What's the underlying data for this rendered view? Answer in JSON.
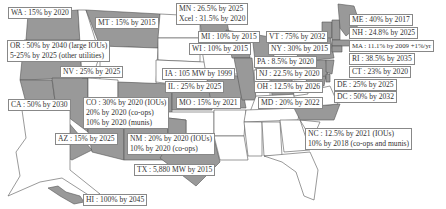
{
  "colors": {
    "policy_state": "#999999",
    "no_policy_state": "#ffffff",
    "border": "#555555",
    "label_border": "#888888"
  },
  "labels": {
    "WA": [
      "WA : 15% by 2020"
    ],
    "MT": [
      "MT : 15% by 2015"
    ],
    "OR": [
      "OR : 50% by 2040 (large IOUs)",
      "5-25% by 2025 (other utilities)"
    ],
    "NV": [
      "NV : 25% by 2025"
    ],
    "CA": [
      "CA : 50% by 2030"
    ],
    "AZ": [
      "AZ : 15% by 2025"
    ],
    "CO": [
      "CO : 30% by 2020 (IOUs)",
      "20% by 2020 (co-ops)",
      "10% by 2020 (munis)"
    ],
    "NM": [
      "NM : 20% by 2020 (IOUs)",
      "10% by 2020 (co-ops)"
    ],
    "TX": [
      "TX : 5,880 MW by 2015"
    ],
    "HI": [
      "HI : 100% by 2045"
    ],
    "MN": [
      "MN : 26.5% by 2025",
      "Xcel : 31.5% by 2020"
    ],
    "MI": [
      "MI : 10% by 2015"
    ],
    "WI": [
      "WI : 10% by 2015"
    ],
    "IA": [
      "IA : 105 MW by 1999"
    ],
    "IL": [
      "IL : 25% by 2025"
    ],
    "MO": [
      "MO : 15% by 2021"
    ],
    "VT": [
      "VT : 75% by 2032"
    ],
    "NY": [
      "NY : 30% by 2015"
    ],
    "PA": [
      "PA : 8.5% by 2020"
    ],
    "NJ": [
      "NJ : 22.5% by 2020"
    ],
    "OH": [
      "OH : 12.5% by 2026"
    ],
    "MD": [
      "MD : 20% by 2022"
    ],
    "ME": [
      "ME : 40% by 2017"
    ],
    "NH": [
      "NH : 24.8% by 2025"
    ],
    "MA": [
      "MA : 11.1% by 2009 +1%/yr"
    ],
    "RI": [
      "RI : 38.5% by 2035"
    ],
    "CT": [
      "CT : 23% by 2020"
    ],
    "DE": [
      "DE : 25% by 2025"
    ],
    "DC": [
      "DC : 50% by 2032"
    ],
    "NC": [
      "NC : 12.5% by 2021 (IOUs)",
      "10% by 2018 (co-ops and munis)"
    ]
  }
}
